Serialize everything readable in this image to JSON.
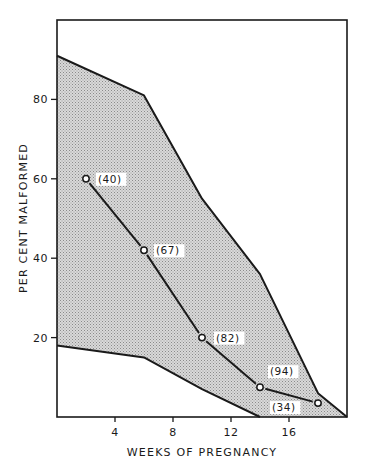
{
  "chart_data": {
    "type": "line",
    "title": "",
    "xlabel": "WEEKS OF PREGNANCY",
    "ylabel": "PER CENT MALFORMED",
    "xlim": [
      0,
      20
    ],
    "ylim": [
      0,
      100
    ],
    "x_ticks": [
      4,
      8,
      12,
      16
    ],
    "x_tick_labels": [
      "4",
      "8",
      "12",
      "16"
    ],
    "y_ticks": [
      20,
      40,
      60,
      80
    ],
    "y_tick_labels": [
      "20",
      "40",
      "60",
      "80"
    ],
    "grid": false,
    "legend": null,
    "series": [
      {
        "name": "Per cent malformed",
        "type": "line",
        "marker": "open-circle",
        "x": [
          2,
          6,
          10,
          14,
          18
        ],
        "y": [
          60,
          42,
          20,
          7.5,
          3.5
        ],
        "point_labels": [
          "(40)",
          "(67)",
          "(82)",
          "(94)",
          "(34)"
        ]
      }
    ],
    "band": {
      "name": "Range (shaded)",
      "fill": "#c8c8c8",
      "upper": {
        "x": [
          0,
          6,
          10,
          14,
          18,
          20
        ],
        "y": [
          91,
          81,
          55,
          36,
          6,
          0
        ]
      },
      "lower": {
        "x": [
          0,
          6,
          10,
          14
        ],
        "y": [
          18,
          15,
          7,
          0
        ]
      }
    },
    "annotations": [
      "(40)",
      "(67)",
      "(82)",
      "(94)",
      "(34)"
    ]
  },
  "colors": {
    "line": "#1a1a1a",
    "band_fill": "#c8c8c8",
    "background": "#ffffff",
    "label_box": "#ffffff"
  }
}
